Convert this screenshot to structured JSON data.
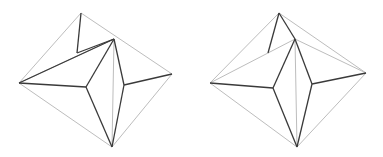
{
  "figures": [
    {
      "name": "polyhedron-left",
      "vertices": {
        "top": [
          81,
          13
        ],
        "peak": [
          114,
          39
        ],
        "left": [
          19,
          83
        ],
        "right": [
          172,
          74
        ],
        "bottom": [
          112,
          147
        ],
        "center": [
          86,
          87
        ],
        "inner_right": [
          124,
          85
        ],
        "ridge_end": [
          77,
          53
        ]
      },
      "light_edges": [
        [
          "top",
          "left"
        ],
        [
          "left",
          "bottom"
        ],
        [
          "bottom",
          "right"
        ],
        [
          "top",
          "right"
        ],
        [
          "peak",
          "bottom"
        ],
        [
          "left",
          "peak"
        ]
      ],
      "dark_edges": [
        [
          "top",
          "ridge_end"
        ],
        [
          "ridge_end",
          "peak"
        ],
        [
          "left",
          "peak"
        ],
        [
          "left",
          "center"
        ],
        [
          "center",
          "peak"
        ],
        [
          "center",
          "bottom"
        ],
        [
          "peak",
          "inner_right"
        ],
        [
          "inner_right",
          "bottom"
        ],
        [
          "inner_right",
          "right"
        ]
      ]
    },
    {
      "name": "polyhedron-right",
      "vertices": {
        "top": [
          279,
          13
        ],
        "peak": [
          295,
          39
        ],
        "left": [
          210,
          83
        ],
        "right": [
          366,
          73
        ],
        "bottom": [
          297,
          147
        ],
        "center": [
          273,
          88
        ],
        "inner_right": [
          312,
          84
        ],
        "ridge_end": [
          268,
          53
        ]
      },
      "light_edges": [
        [
          "top",
          "left"
        ],
        [
          "left",
          "bottom"
        ],
        [
          "bottom",
          "right"
        ],
        [
          "top",
          "right"
        ],
        [
          "peak",
          "bottom"
        ],
        [
          "left",
          "peak"
        ],
        [
          "peak",
          "right"
        ]
      ],
      "dark_edges": [
        [
          "top",
          "ridge_end"
        ],
        [
          "top",
          "peak"
        ],
        [
          "left",
          "center"
        ],
        [
          "center",
          "peak"
        ],
        [
          "center",
          "bottom"
        ],
        [
          "peak",
          "inner_right"
        ],
        [
          "inner_right",
          "bottom"
        ],
        [
          "inner_right",
          "right"
        ]
      ]
    }
  ]
}
